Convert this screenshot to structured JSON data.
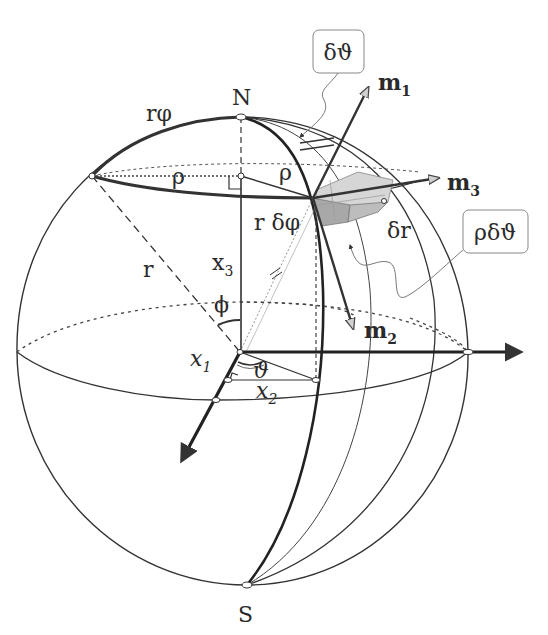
{
  "figure": {
    "poles": {
      "north": "N",
      "south": "S"
    },
    "labels": {
      "arc_r_phi": "rφ",
      "rho_left": "ρ",
      "rho_right": "ρ",
      "r_delta_phi": "r δφ",
      "delta_r": "δr",
      "x3": "x",
      "x3_sub": "3",
      "x1": "x",
      "x1_sub": "1",
      "x2": "x",
      "x2_sub": "2",
      "radius": "r",
      "phi": "ϕ",
      "theta": "ϑ"
    },
    "unit_vectors": [
      {
        "name": "m",
        "sub": "1"
      },
      {
        "name": "m",
        "sub": "2"
      },
      {
        "name": "m",
        "sub": "3"
      }
    ],
    "callouts": [
      {
        "id": "delta-theta",
        "text": "δϑ"
      },
      {
        "id": "rho-delta-theta",
        "text": "ρδϑ"
      }
    ],
    "colors": {
      "line": "#333333",
      "element_fill_light": "#d4d4d4",
      "element_fill_dark": "#a8a8a8",
      "arrowhead_light": "#cfcfcf",
      "callout_border": "#888888"
    }
  }
}
